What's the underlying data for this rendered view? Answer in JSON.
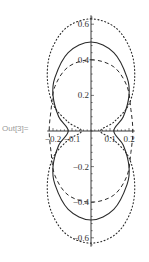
{
  "cell": {
    "output_label": "Out[3]="
  },
  "chart_data": {
    "type": "line",
    "title": "",
    "xlabel": "",
    "ylabel": "",
    "xlim": [
      -0.23,
      0.23
    ],
    "ylim": [
      -0.65,
      0.65
    ],
    "grid": false,
    "legend": null,
    "x_ticks": [
      "-0.2",
      "-0.1",
      "0.1",
      "0.2"
    ],
    "y_ticks": [
      "0.6",
      "0.4",
      "0.2",
      "-0.2",
      "-0.4",
      "-0.6"
    ],
    "series": [
      {
        "name": "solid",
        "style": "solid",
        "description": "figure-eight curve, lobes peak at y=±0.5, max half-width ≈0.2, crosses x-axis at x≈±0.12",
        "points": [
          [
            0,
            0.5
          ],
          [
            0.12,
            0.44
          ],
          [
            0.19,
            0.3
          ],
          [
            0.2,
            0.2
          ],
          [
            0.17,
            0.08
          ],
          [
            0.12,
            0
          ],
          [
            0.17,
            -0.08
          ],
          [
            0.2,
            -0.2
          ],
          [
            0.19,
            -0.3
          ],
          [
            0.12,
            -0.44
          ],
          [
            0,
            -0.5
          ],
          [
            -0.12,
            -0.44
          ],
          [
            -0.19,
            -0.3
          ],
          [
            -0.2,
            -0.2
          ],
          [
            -0.17,
            -0.08
          ],
          [
            -0.12,
            0
          ],
          [
            -0.17,
            0.08
          ],
          [
            -0.2,
            0.2
          ],
          [
            -0.19,
            0.3
          ],
          [
            -0.12,
            0.44
          ],
          [
            0,
            0.5
          ]
        ]
      },
      {
        "name": "dashed",
        "style": "dashed",
        "description": "figure-eight curve, lobes peak at y=±0.4, max half-width ≈0.22 near x-axis",
        "points": [
          [
            0,
            0.4
          ],
          [
            0.12,
            0.36
          ],
          [
            0.19,
            0.25
          ],
          [
            0.21,
            0.12
          ],
          [
            0.22,
            0
          ],
          [
            0.21,
            -0.12
          ],
          [
            0.19,
            -0.25
          ],
          [
            0.12,
            -0.36
          ],
          [
            0,
            -0.4
          ],
          [
            -0.12,
            -0.36
          ],
          [
            -0.19,
            -0.25
          ],
          [
            -0.21,
            -0.12
          ],
          [
            -0.22,
            0
          ],
          [
            -0.21,
            0.12
          ],
          [
            -0.19,
            0.25
          ],
          [
            -0.12,
            0.36
          ],
          [
            0,
            0.4
          ]
        ]
      },
      {
        "name": "dotted",
        "style": "dotted",
        "description": "outer figure-eight curve, lobes peak at y=±0.63, max half-width ≈0.23, pinches toward x≈±0.05 at the x-axis",
        "points": [
          [
            0,
            0.63
          ],
          [
            0.13,
            0.58
          ],
          [
            0.21,
            0.45
          ],
          [
            0.23,
            0.3
          ],
          [
            0.2,
            0.15
          ],
          [
            0.12,
            0.05
          ],
          [
            0.05,
            0
          ],
          [
            0.12,
            -0.05
          ],
          [
            0.2,
            -0.15
          ],
          [
            0.23,
            -0.3
          ],
          [
            0.21,
            -0.45
          ],
          [
            0.13,
            -0.58
          ],
          [
            0,
            -0.63
          ],
          [
            -0.13,
            -0.58
          ],
          [
            -0.21,
            -0.45
          ],
          [
            -0.23,
            -0.3
          ],
          [
            -0.2,
            -0.15
          ],
          [
            -0.12,
            -0.05
          ],
          [
            -0.05,
            0
          ],
          [
            -0.12,
            0.05
          ],
          [
            -0.2,
            0.15
          ],
          [
            -0.23,
            0.3
          ],
          [
            -0.21,
            0.45
          ],
          [
            -0.13,
            0.58
          ],
          [
            0,
            0.63
          ]
        ]
      }
    ]
  }
}
